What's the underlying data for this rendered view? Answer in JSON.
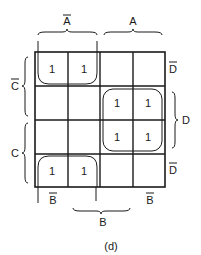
{
  "kmap": {
    "caption": "(d)",
    "top_labels": {
      "a_bar": "A",
      "a": "A"
    },
    "left_labels": {
      "c_bar": "C",
      "c": "C"
    },
    "right_labels": {
      "d_bar_top": "D",
      "d": "D",
      "d_bar_bottom": "D"
    },
    "bottom_labels": {
      "b_bar_left": "B",
      "b": "B",
      "b_bar_right": "B"
    },
    "overbar_labels": [
      "A-bar (top-left)",
      "C-bar (left-top)",
      "D-bar (right top/bottom)",
      "B-bar (bottom left/right)"
    ],
    "cells": [
      [
        "1",
        "1",
        "",
        ""
      ],
      [
        "",
        "",
        "1",
        "1"
      ],
      [
        "",
        "",
        "1",
        "1"
      ],
      [
        "1",
        "1",
        "",
        ""
      ]
    ],
    "groups": [
      {
        "name": "group-top-left",
        "rows": [
          0
        ],
        "cols": [
          0,
          1
        ]
      },
      {
        "name": "group-center-right",
        "rows": [
          1,
          2
        ],
        "cols": [
          2,
          3
        ]
      },
      {
        "name": "group-bottom-left",
        "rows": [
          3
        ],
        "cols": [
          0,
          1
        ]
      }
    ]
  }
}
